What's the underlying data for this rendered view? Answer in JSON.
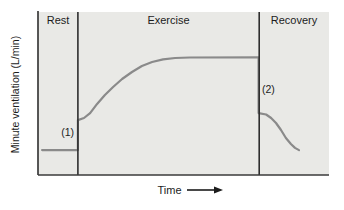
{
  "figure": {
    "y_axis_label": "Minute ventilation (L/min)",
    "x_axis_label": "Time",
    "phase_labels": {
      "rest": "Rest",
      "exercise": "Exercise",
      "recovery": "Recovery"
    },
    "annotations": {
      "onset_step": "(1)",
      "offset_step": "(2)"
    }
  },
  "colors": {
    "page_background": "#ffffff",
    "plot_background": "#e9e9e6",
    "axis_line": "#3a3a3a",
    "boundary_line": "#2e2e2e",
    "curve": "#8a8a8a",
    "text": "#1c1c1c"
  },
  "chart_data": {
    "type": "line",
    "title": "",
    "xlabel": "Time",
    "ylabel": "Minute ventilation (L/min)",
    "x_range": [
      0,
      100
    ],
    "y_range": [
      0,
      100
    ],
    "axis_numeric_ticks": false,
    "grid": false,
    "legend": "none",
    "phases": [
      {
        "label": "Rest",
        "t_start": 0,
        "t_end": 13.7
      },
      {
        "label": "Exercise",
        "t_start": 13.7,
        "t_end": 76
      },
      {
        "label": "Recovery",
        "t_start": 76,
        "t_end": 100
      }
    ],
    "phase_boundaries_t": [
      13.7,
      76
    ],
    "series": [
      {
        "name": "Minute ventilation",
        "points": [
          [
            1.4,
            15.3
          ],
          [
            13.7,
            15.3
          ],
          [
            13.7,
            33.7
          ],
          [
            15.8,
            35.0
          ],
          [
            17.9,
            38.0
          ],
          [
            20.3,
            43.6
          ],
          [
            23.0,
            49.1
          ],
          [
            25.8,
            54.0
          ],
          [
            28.9,
            58.9
          ],
          [
            32.3,
            63.2
          ],
          [
            35.7,
            66.9
          ],
          [
            39.2,
            69.3
          ],
          [
            43.0,
            70.9
          ],
          [
            47.1,
            71.8
          ],
          [
            52.2,
            72.1
          ],
          [
            75.8,
            72.2
          ],
          [
            75.8,
            38.0
          ],
          [
            78.4,
            37.1
          ],
          [
            80.1,
            35.0
          ],
          [
            81.8,
            31.9
          ],
          [
            83.5,
            27.6
          ],
          [
            85.2,
            22.7
          ],
          [
            86.9,
            19.0
          ],
          [
            88.3,
            16.6
          ],
          [
            89.7,
            15.3
          ]
        ]
      }
    ],
    "annotations": [
      {
        "label": "(1)",
        "t": 13.7,
        "v": 24
      },
      {
        "label": "(2)",
        "t": 78,
        "v": 52
      }
    ]
  }
}
